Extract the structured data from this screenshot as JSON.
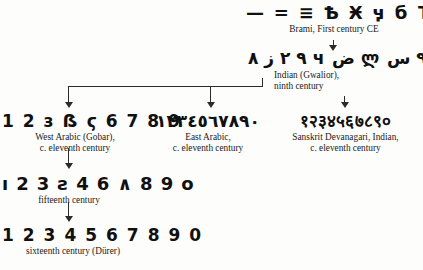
{
  "diagram": {
    "background_color": "#fdfdfc",
    "ink_color": "#1a1a1a",
    "nodes": [
      {
        "id": "brahmi",
        "glyphs": "— = ≡ Ѣ Ӿ ӌ б Ъ Ғ З",
        "caption": "Brami, First century CE"
      },
      {
        "id": "gwalior",
        "glyphs": "٩ ٢ ز ٨ ч ض ლ ٩ س ф °",
        "caption_line1": "Indian (Gwalior),",
        "caption_line2": "ninth century"
      },
      {
        "id": "west_arabic",
        "glyphs": "1 2 з ẞ ϛ 6 7 8 9",
        "caption_line1": "West Arabic (Gobar),",
        "caption_line2": "c. eleventh century"
      },
      {
        "id": "east_arabic",
        "glyphs": "١٢٣٤٥٦٧٨٩٠",
        "caption_line1": "East Arabic,",
        "caption_line2": "c. eleventh century"
      },
      {
        "id": "devanagari",
        "glyphs": "१२३४५६७८९०",
        "caption_line1": "Sanskrit Devanagari, Indian,",
        "caption_line2": "c. eleventh century"
      },
      {
        "id": "fifteenth",
        "glyphs": "ı 2 3 ƨ 4 6 ∧ 8 9 o",
        "caption": "fifteenth century"
      },
      {
        "id": "sixteenth",
        "glyphs": "1 2 3 4 5 6 7 8 9 0",
        "caption": "sixteenth century (Dürer)"
      }
    ]
  }
}
